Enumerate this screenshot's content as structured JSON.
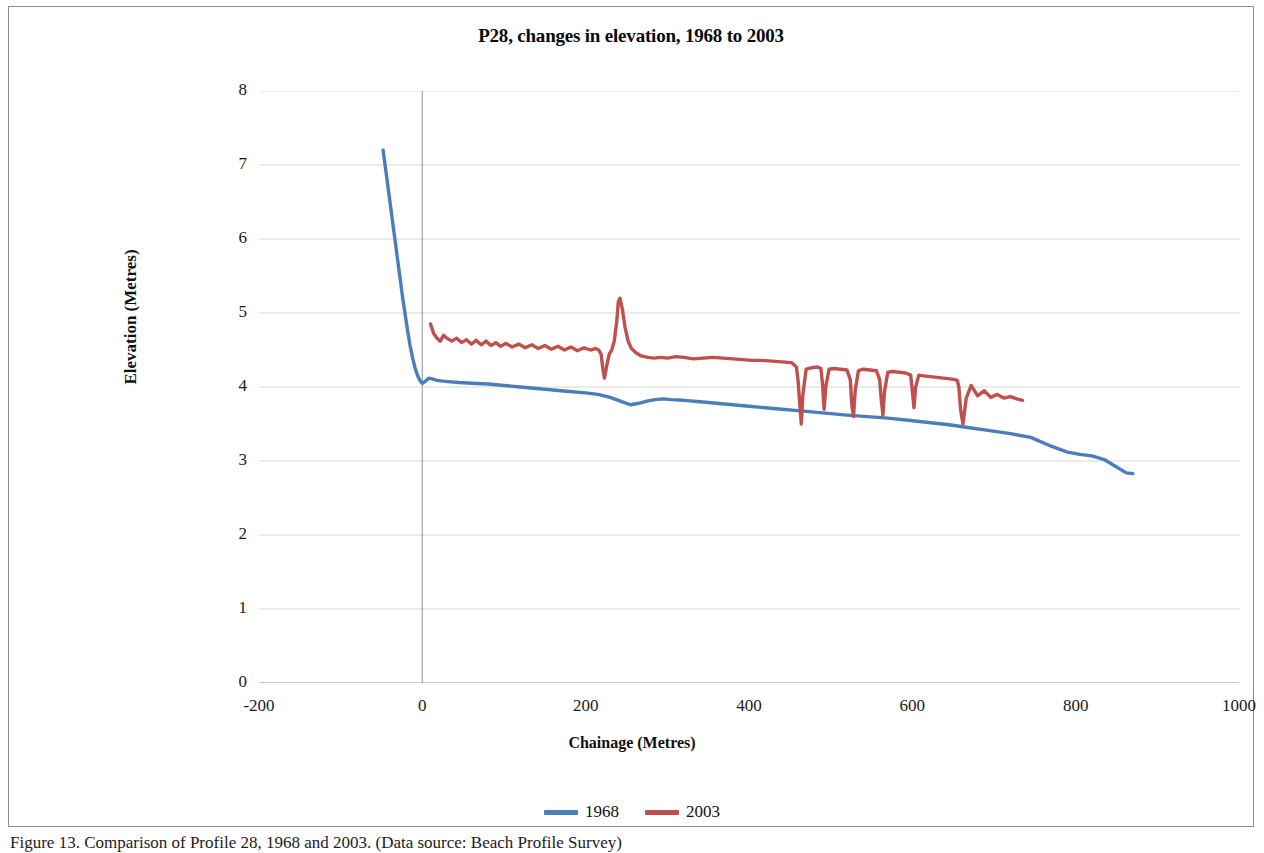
{
  "figure": {
    "caption": "Figure 13. Comparison of Profile 28, 1968 and 2003. (Data source: Beach Profile Survey)"
  },
  "chart_data": {
    "type": "line",
    "title": "P28, changes in elevation, 1968 to 2003",
    "xlabel": "Chainage (Metres)",
    "ylabel": "Elevation (Metres)",
    "xlim": [
      -200,
      1000
    ],
    "ylim": [
      0,
      8
    ],
    "xticks": [
      -200,
      0,
      200,
      400,
      600,
      800,
      1000
    ],
    "yticks": [
      0,
      1,
      2,
      3,
      4,
      5,
      6,
      7,
      8
    ],
    "grid": "horizontal",
    "legend_position": "bottom",
    "colors": {
      "series_1968": "#4a7ebb",
      "series_2003": "#c0504d",
      "gridline": "#d9d9cf",
      "axis": "#a6a6a6",
      "frame": "#8d8d8d",
      "text": "#111111"
    },
    "series": [
      {
        "name": "1968",
        "color": "#4a7ebb",
        "x": [
          -48,
          -45,
          -42,
          -39,
          -36,
          -33,
          -30,
          -27,
          -24,
          -21,
          -18,
          -15,
          -12,
          -9,
          -6,
          -3,
          0,
          4,
          8,
          12,
          18,
          25,
          35,
          45,
          60,
          80,
          100,
          120,
          140,
          160,
          180,
          200,
          215,
          230,
          245,
          255,
          265,
          275,
          285,
          295,
          305,
          320,
          340,
          360,
          380,
          400,
          420,
          440,
          460,
          480,
          500,
          520,
          545,
          570,
          595,
          620,
          645,
          670,
          695,
          720,
          745,
          770,
          790,
          805,
          820,
          835,
          850,
          862,
          870
        ],
        "y": [
          7.2,
          6.95,
          6.7,
          6.45,
          6.2,
          5.95,
          5.7,
          5.45,
          5.2,
          4.98,
          4.76,
          4.56,
          4.4,
          4.26,
          4.16,
          4.09,
          4.05,
          4.08,
          4.12,
          4.11,
          4.09,
          4.08,
          4.07,
          4.06,
          4.05,
          4.04,
          4.02,
          4.0,
          3.98,
          3.96,
          3.94,
          3.92,
          3.9,
          3.86,
          3.8,
          3.76,
          3.78,
          3.81,
          3.83,
          3.84,
          3.83,
          3.82,
          3.8,
          3.78,
          3.76,
          3.74,
          3.72,
          3.7,
          3.68,
          3.66,
          3.64,
          3.62,
          3.6,
          3.58,
          3.55,
          3.52,
          3.49,
          3.45,
          3.41,
          3.37,
          3.32,
          3.2,
          3.12,
          3.09,
          3.07,
          3.02,
          2.92,
          2.84,
          2.83
        ]
      },
      {
        "name": "2003",
        "color": "#c0504d",
        "x": [
          10,
          14,
          18,
          22,
          26,
          30,
          36,
          42,
          48,
          54,
          60,
          66,
          72,
          78,
          84,
          90,
          96,
          102,
          110,
          118,
          126,
          134,
          142,
          150,
          158,
          166,
          174,
          182,
          190,
          198,
          206,
          212,
          216,
          219,
          221,
          223,
          226,
          229,
          232,
          235,
          238,
          240,
          242,
          245,
          248,
          252,
          256,
          262,
          268,
          276,
          284,
          292,
          300,
          310,
          320,
          332,
          344,
          356,
          368,
          380,
          392,
          404,
          416,
          428,
          440,
          452,
          458,
          460,
          462,
          464,
          466,
          470,
          476,
          484,
          488,
          490,
          492,
          494,
          498,
          504,
          512,
          520,
          524,
          526,
          528,
          530,
          534,
          540,
          548,
          556,
          560,
          562,
          564,
          566,
          570,
          576,
          584,
          592,
          598,
          600,
          602,
          604,
          608,
          614,
          622,
          630,
          638,
          646,
          652,
          655,
          657,
          659,
          662,
          666,
          672,
          680,
          688,
          696,
          704,
          712,
          720,
          728,
          735
        ],
        "y": [
          4.85,
          4.72,
          4.66,
          4.62,
          4.7,
          4.66,
          4.62,
          4.66,
          4.6,
          4.64,
          4.58,
          4.63,
          4.57,
          4.62,
          4.56,
          4.6,
          4.55,
          4.59,
          4.54,
          4.58,
          4.53,
          4.57,
          4.52,
          4.56,
          4.51,
          4.55,
          4.5,
          4.54,
          4.49,
          4.53,
          4.5,
          4.52,
          4.5,
          4.44,
          4.25,
          4.12,
          4.3,
          4.45,
          4.5,
          4.62,
          4.88,
          5.15,
          5.2,
          5.05,
          4.82,
          4.62,
          4.52,
          4.46,
          4.42,
          4.4,
          4.39,
          4.4,
          4.39,
          4.41,
          4.4,
          4.38,
          4.39,
          4.4,
          4.39,
          4.38,
          4.37,
          4.36,
          4.36,
          4.35,
          4.34,
          4.33,
          4.27,
          4.1,
          3.8,
          3.5,
          3.9,
          4.24,
          4.26,
          4.27,
          4.25,
          4.05,
          3.7,
          4.0,
          4.24,
          4.25,
          4.24,
          4.23,
          4.1,
          3.75,
          3.6,
          3.95,
          4.22,
          4.24,
          4.23,
          4.22,
          4.1,
          3.82,
          3.62,
          3.95,
          4.2,
          4.21,
          4.2,
          4.19,
          4.16,
          3.95,
          3.72,
          4.0,
          4.16,
          4.15,
          4.14,
          4.13,
          4.12,
          4.11,
          4.1,
          4.09,
          4.0,
          3.7,
          3.5,
          3.85,
          4.02,
          3.88,
          3.95,
          3.86,
          3.9,
          3.85,
          3.87,
          3.84,
          3.82
        ]
      }
    ]
  },
  "legend": {
    "entries": [
      {
        "label": "1968",
        "color": "#4a7ebb"
      },
      {
        "label": "2003",
        "color": "#c0504d"
      }
    ]
  }
}
